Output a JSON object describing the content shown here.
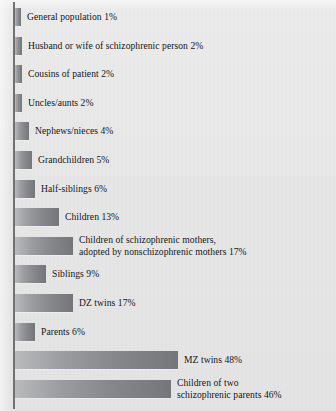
{
  "chart_data": {
    "type": "bar",
    "orientation": "horizontal",
    "title": "",
    "subtitle": "",
    "xlabel": "",
    "ylabel": "",
    "xlim": [
      0,
      50
    ],
    "grid": false,
    "legend": null,
    "unit": "%",
    "categories": [
      "General population",
      "Husband or wife of schizophrenic person",
      "Cousins of patient",
      "Uncles/aunts",
      "Nephews/nieces",
      "Grandchildren",
      "Half-siblings",
      "Children",
      "Children of schizophrenic mothers, adopted by nonschizophrenic mothers",
      "Siblings",
      "DZ twins",
      "Parents",
      "MZ twins",
      "Children of two schizophrenic parents"
    ],
    "values": [
      1,
      2,
      2,
      2,
      4,
      5,
      6,
      13,
      17,
      9,
      17,
      6,
      48,
      46
    ],
    "bars": [
      {
        "label": "General population 1%",
        "label_line1": "General population 1%",
        "label_line2": "",
        "category": "General population",
        "value": 1
      },
      {
        "label": "Husband or wife of schizophrenic person 2%",
        "label_line1": "Husband or wife of schizophrenic person 2%",
        "label_line2": "",
        "category": "Husband or wife of schizophrenic person",
        "value": 2
      },
      {
        "label": "Cousins of patient 2%",
        "label_line1": "Cousins of patient 2%",
        "label_line2": "",
        "category": "Cousins of patient",
        "value": 2
      },
      {
        "label": "Uncles/aunts 2%",
        "label_line1": "Uncles/aunts 2%",
        "label_line2": "",
        "category": "Uncles/aunts",
        "value": 2
      },
      {
        "label": "Nephews/nieces 4%",
        "label_line1": "Nephews/nieces 4%",
        "label_line2": "",
        "category": "Nephews/nieces",
        "value": 4
      },
      {
        "label": "Grandchildren 5%",
        "label_line1": "Grandchildren 5%",
        "label_line2": "",
        "category": "Grandchildren",
        "value": 5
      },
      {
        "label": "Half-siblings 6%",
        "label_line1": "Half-siblings 6%",
        "label_line2": "",
        "category": "Half-siblings",
        "value": 6
      },
      {
        "label": "Children 13%",
        "label_line1": "Children 13%",
        "label_line2": "",
        "category": "Children",
        "value": 13
      },
      {
        "label": "Children of schizophrenic mothers, adopted by nonschizophrenic mothers 17%",
        "label_line1": "Children of schizophrenic mothers,",
        "label_line2": "adopted by nonschizophrenic mothers 17%",
        "category": "Children of schizophrenic mothers, adopted by nonschizophrenic mothers",
        "value": 17
      },
      {
        "label": "Siblings 9%",
        "label_line1": "Siblings 9%",
        "label_line2": "",
        "category": "Siblings",
        "value": 9
      },
      {
        "label": "DZ twins 17%",
        "label_line1": "DZ twins 17%",
        "label_line2": "",
        "category": "DZ twins",
        "value": 17
      },
      {
        "label": "Parents 6%",
        "label_line1": "Parents 6%",
        "label_line2": "",
        "category": "Parents",
        "value": 6
      },
      {
        "label": "MZ twins 48%",
        "label_line1": "MZ twins 48%",
        "label_line2": "",
        "category": "MZ twins",
        "value": 48
      },
      {
        "label": "Children of two schizophrenic parents 46%",
        "label_line1": "Children of two",
        "label_line2": "schizophrenic parents 46%",
        "category": "Children of two schizophrenic parents",
        "value": 46
      }
    ],
    "colors": {
      "background": "#e9e9e9",
      "bar_light": "#b9babc",
      "bar_dark": "#74767a",
      "axis": "#6f7175",
      "text": "#15171a"
    }
  }
}
